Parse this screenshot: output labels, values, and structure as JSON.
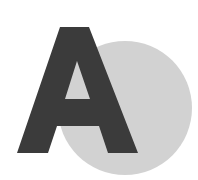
{
  "logo": {
    "letter": "A",
    "icon": "letter-a-with-circle-logo",
    "colors": {
      "background": "#ffffff",
      "letter": "#3b3b3b",
      "circle": "#d2d2d2"
    }
  }
}
